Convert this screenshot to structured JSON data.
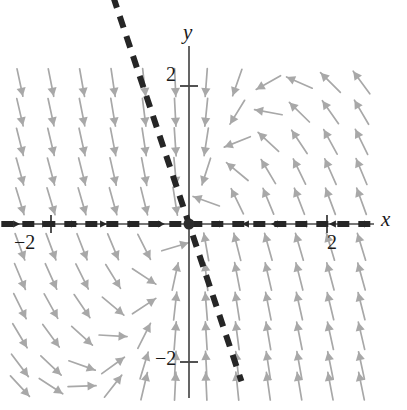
{
  "figure": {
    "kind": "direction-field",
    "background_color": "#ffffff"
  },
  "axes": {
    "x_label": "x",
    "y_label": "y",
    "x_axis_color": "#4a4a4a",
    "y_axis_color": "#4a4a4a",
    "origin_px": {
      "x": 189,
      "y": 224
    },
    "unit_px": 69,
    "ticks": {
      "x_positive": "2",
      "x_negative": "−2",
      "y_positive": "2",
      "y_negative": "−2"
    },
    "tick_positions": {
      "x_positive_value": 2,
      "x_negative_value": -2,
      "y_positive_value": 2,
      "y_negative_value": -2
    },
    "x_range": [
      -2.72,
      2.72
    ],
    "y_range": [
      -2.6,
      2.25
    ]
  },
  "eigen_lines": {
    "color": "#262626",
    "dash_pattern": "12 9",
    "width": 6,
    "lines": [
      {
        "name": "steep-eigenvector-line",
        "slope": -3.0,
        "x_from": -1.1,
        "x_to": 0.76,
        "description": "dashed line through origin with steep negative slope"
      },
      {
        "name": "horizontal-eigenvector-line",
        "slope": 0.0,
        "x_from": -2.72,
        "x_to": 2.72,
        "description": "dashed line lying along the x-axis"
      }
    ]
  },
  "origin_dot": {
    "name": "equilibrium-point",
    "color": "#2b2b2b",
    "radius_px": 5.5,
    "x": 0,
    "y": 0
  },
  "chart_data": {
    "type": "scatter",
    "title": "",
    "xlabel": "x",
    "ylabel": "y",
    "xlim": [
      -2.72,
      2.72
    ],
    "ylim": [
      -2.6,
      2.25
    ],
    "grid": false,
    "legend": "none",
    "field": {
      "name": "direction-field-arrows",
      "arrow_color": "#a8a8a8",
      "system": "dx/dt = -x,  dy/dt = 3x - 2y",
      "eigenvalues": [
        -1,
        -2
      ],
      "grid_nx": 11,
      "grid_ny": 10,
      "x_values": [
        -2.45,
        -2.0,
        -1.55,
        -1.1,
        -0.65,
        -0.2,
        0.25,
        0.7,
        1.15,
        1.6,
        2.05,
        2.5
      ],
      "y_values": [
        2.05,
        1.62,
        1.19,
        0.76,
        0.33,
        -0.33,
        -0.76,
        -1.19,
        -1.62,
        -2.05,
        -2.35
      ],
      "arrow_len_px": 28
    },
    "annotations": [
      {
        "text": "2",
        "x": 2,
        "y": 0,
        "role": "x-tick"
      },
      {
        "text": "−2",
        "x": -2,
        "y": 0,
        "role": "x-tick"
      },
      {
        "text": "2",
        "x": 0,
        "y": 2,
        "role": "y-tick"
      },
      {
        "text": "−2",
        "x": 0,
        "y": -2,
        "role": "y-tick"
      },
      {
        "text": "x",
        "x": 2.8,
        "y": 0,
        "role": "axis-name"
      },
      {
        "text": "y",
        "x": 0,
        "y": 2.6,
        "role": "axis-name"
      }
    ]
  }
}
